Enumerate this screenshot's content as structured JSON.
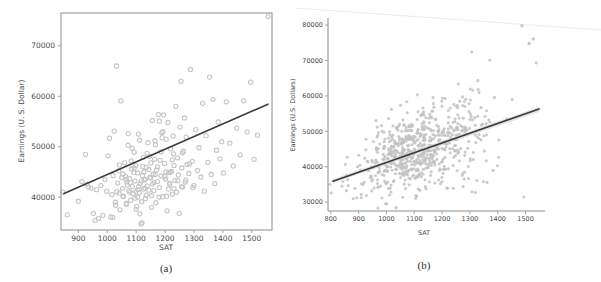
{
  "figure": {
    "background": "#ffffff",
    "marker_color": "#c2c2c2",
    "line_color": "#3b3b3b",
    "spine_color": "#8c8c8c"
  },
  "panels": [
    {
      "id": "a",
      "caption": "(a)",
      "xlabel": "SAT",
      "ylabel": "Earnings (U. S. Dollar)",
      "xticks": [
        "900",
        "1000",
        "1100",
        "1200",
        "1300",
        "1400",
        "1500"
      ],
      "yticks": [
        "40000",
        "50000",
        "60000",
        "70000"
      ]
    },
    {
      "id": "b",
      "caption": "(b)",
      "xlabel": "SAT",
      "ylabel": "Earnings (U.S. Dollars)",
      "xticks": [
        "800",
        "900",
        "1000",
        "1100",
        "1200",
        "1300",
        "1400",
        "1500"
      ],
      "yticks": [
        "30000",
        "40000",
        "50000",
        "60000",
        "70000",
        "80000"
      ]
    }
  ],
  "chart_data": [
    {
      "type": "scatter",
      "panel": "a",
      "title": "",
      "xlabel": "SAT",
      "ylabel": "Earnings (U. S. Dollar)",
      "xlim": [
        840,
        1570
      ],
      "ylim": [
        33500,
        76500
      ],
      "xticks": [
        900,
        1000,
        1100,
        1200,
        1300,
        1400,
        1500
      ],
      "yticks": [
        40000,
        50000,
        60000,
        70000
      ],
      "grid": false,
      "legend": null,
      "n_points": 200,
      "marker": "open-circle",
      "fit_line": {
        "x": [
          845,
          1560
        ],
        "y": [
          37800,
          56700
        ],
        "slope": 26.4,
        "intercept": 15500
      },
      "points": [
        [
          846,
          41000
        ],
        [
          862,
          36500
        ],
        [
          900,
          39200
        ],
        [
          912,
          43100
        ],
        [
          925,
          48500
        ],
        [
          930,
          42600
        ],
        [
          935,
          42000
        ],
        [
          944,
          41800
        ],
        [
          952,
          36800
        ],
        [
          958,
          35400
        ],
        [
          963,
          41500
        ],
        [
          970,
          35800
        ],
        [
          978,
          42300
        ],
        [
          985,
          36400
        ],
        [
          992,
          43500
        ],
        [
          998,
          41200
        ],
        [
          1003,
          48200
        ],
        [
          1008,
          51700
        ],
        [
          1012,
          36100
        ],
        [
          1016,
          40500
        ],
        [
          1020,
          44300
        ],
        [
          1024,
          53100
        ],
        [
          1028,
          39000
        ],
        [
          1032,
          66000
        ],
        [
          1036,
          42800
        ],
        [
          1040,
          45200
        ],
        [
          1044,
          37500
        ],
        [
          1047,
          59100
        ],
        [
          1050,
          43900
        ],
        [
          1053,
          41700
        ],
        [
          1056,
          40200
        ],
        [
          1060,
          46800
        ],
        [
          1063,
          44100
        ],
        [
          1066,
          38600
        ],
        [
          1069,
          42400
        ],
        [
          1072,
          50300
        ],
        [
          1075,
          41300
        ],
        [
          1078,
          43700
        ],
        [
          1081,
          39400
        ],
        [
          1084,
          45600
        ],
        [
          1087,
          42100
        ],
        [
          1090,
          40700
        ],
        [
          1093,
          48900
        ],
        [
          1096,
          43200
        ],
        [
          1099,
          41100
        ],
        [
          1102,
          38200
        ],
        [
          1105,
          44800
        ],
        [
          1108,
          52500
        ],
        [
          1111,
          40900
        ],
        [
          1114,
          42700
        ],
        [
          1117,
          34700
        ],
        [
          1120,
          34900
        ],
        [
          1123,
          46100
        ],
        [
          1126,
          41600
        ],
        [
          1129,
          43400
        ],
        [
          1132,
          39700
        ],
        [
          1135,
          45900
        ],
        [
          1138,
          42200
        ],
        [
          1141,
          50800
        ],
        [
          1144,
          41400
        ],
        [
          1147,
          48100
        ],
        [
          1150,
          43800
        ],
        [
          1153,
          40300
        ],
        [
          1156,
          55200
        ],
        [
          1159,
          44600
        ],
        [
          1162,
          42900
        ],
        [
          1165,
          51200
        ],
        [
          1168,
          38900
        ],
        [
          1171,
          45400
        ],
        [
          1174,
          43100
        ],
        [
          1177,
          56400
        ],
        [
          1180,
          41900
        ],
        [
          1183,
          47300
        ],
        [
          1186,
          44200
        ],
        [
          1189,
          52800
        ],
        [
          1192,
          40100
        ],
        [
          1195,
          56300
        ],
        [
          1198,
          46700
        ],
        [
          1201,
          43600
        ],
        [
          1204,
          51500
        ],
        [
          1207,
          37300
        ],
        [
          1210,
          54800
        ],
        [
          1213,
          44900
        ],
        [
          1216,
          42500
        ],
        [
          1219,
          49600
        ],
        [
          1222,
          45100
        ],
        [
          1225,
          40600
        ],
        [
          1228,
          52100
        ],
        [
          1231,
          46300
        ],
        [
          1234,
          43300
        ],
        [
          1237,
          58000
        ],
        [
          1240,
          41000
        ],
        [
          1243,
          47800
        ],
        [
          1246,
          44400
        ],
        [
          1249,
          36800
        ],
        [
          1252,
          53900
        ],
        [
          1255,
          63000
        ],
        [
          1258,
          45800
        ],
        [
          1261,
          42000
        ],
        [
          1264,
          49100
        ],
        [
          1267,
          55700
        ],
        [
          1270,
          43000
        ],
        [
          1273,
          51900
        ],
        [
          1276,
          46500
        ],
        [
          1282,
          44700
        ],
        [
          1288,
          65300
        ],
        [
          1294,
          47100
        ],
        [
          1300,
          42300
        ],
        [
          1306,
          53400
        ],
        [
          1312,
          45300
        ],
        [
          1318,
          49800
        ],
        [
          1324,
          44000
        ],
        [
          1330,
          58600
        ],
        [
          1336,
          41200
        ],
        [
          1342,
          52200
        ],
        [
          1348,
          46900
        ],
        [
          1354,
          63800
        ],
        [
          1360,
          44500
        ],
        [
          1366,
          59400
        ],
        [
          1372,
          42700
        ],
        [
          1378,
          49300
        ],
        [
          1384,
          54900
        ],
        [
          1390,
          47600
        ],
        [
          1396,
          51000
        ],
        [
          1402,
          44800
        ],
        [
          1412,
          58900
        ],
        [
          1424,
          50700
        ],
        [
          1436,
          46200
        ],
        [
          1448,
          53700
        ],
        [
          1460,
          48400
        ],
        [
          1472,
          59100
        ],
        [
          1484,
          52900
        ],
        [
          1496,
          62800
        ],
        [
          1508,
          47500
        ],
        [
          1520,
          52300
        ],
        [
          1556,
          75800
        ],
        [
          1065,
          43500
        ],
        [
          1078,
          41000
        ],
        [
          1092,
          44900
        ],
        [
          1105,
          40000
        ],
        [
          1118,
          43200
        ],
        [
          1131,
          41800
        ],
        [
          1144,
          45500
        ],
        [
          1157,
          42600
        ],
        [
          1083,
          47200
        ],
        [
          1096,
          39800
        ],
        [
          1109,
          42100
        ],
        [
          1122,
          44300
        ],
        [
          1135,
          40400
        ],
        [
          1148,
          43900
        ],
        [
          1161,
          41300
        ],
        [
          1174,
          46000
        ],
        [
          1041,
          40800
        ],
        [
          1054,
          44600
        ],
        [
          1067,
          38800
        ],
        [
          1080,
          42900
        ],
        [
          1093,
          45800
        ],
        [
          1106,
          41500
        ],
        [
          1119,
          39100
        ],
        [
          1132,
          43600
        ],
        [
          1186,
          49000
        ],
        [
          1199,
          44100
        ],
        [
          1212,
          41600
        ],
        [
          1225,
          47400
        ],
        [
          1190,
          51800
        ],
        [
          1203,
          45000
        ],
        [
          1216,
          42800
        ],
        [
          1229,
          48600
        ],
        [
          1029,
          38400
        ],
        [
          1042,
          46400
        ],
        [
          1055,
          40100
        ],
        [
          1068,
          43000
        ],
        [
          1260,
          48800
        ],
        [
          1272,
          43400
        ],
        [
          1284,
          46600
        ],
        [
          1296,
          41900
        ],
        [
          1019,
          36000
        ],
        [
          1033,
          41100
        ],
        [
          1153,
          38000
        ],
        [
          1166,
          44500
        ],
        [
          1179,
          40000
        ],
        [
          1100,
          37600
        ],
        [
          1113,
          36700
        ],
        [
          1126,
          45000
        ],
        [
          1205,
          40200
        ],
        [
          1218,
          44900
        ],
        [
          1231,
          41700
        ],
        [
          1244,
          43300
        ],
        [
          1257,
          42100
        ],
        [
          1193,
          53000
        ],
        [
          1180,
          55100
        ],
        [
          1167,
          50400
        ],
        [
          1073,
          52600
        ],
        [
          1086,
          49700
        ],
        [
          1099,
          46300
        ],
        [
          1112,
          51300
        ],
        [
          1125,
          47900
        ],
        [
          1138,
          48700
        ],
        [
          1151,
          46800
        ],
        [
          1164,
          47500
        ]
      ]
    },
    {
      "type": "scatter",
      "panel": "b",
      "title": "",
      "xlabel": "SAT",
      "ylabel": "Earnings (U.S. Dollars)",
      "xlim": [
        790,
        1570
      ],
      "ylim": [
        27500,
        82000
      ],
      "xticks": [
        800,
        900,
        1000,
        1100,
        1200,
        1300,
        1400,
        1500
      ],
      "yticks": [
        30000,
        40000,
        50000,
        60000,
        70000,
        80000
      ],
      "grid": false,
      "legend": null,
      "n_points": 700,
      "marker": "filled-circle",
      "fit_line": {
        "x": [
          805,
          1560
        ],
        "y": [
          36600,
          56700
        ],
        "slope": 26.6,
        "intercept": 15200
      },
      "ci_band": true,
      "outliers": [
        [
          1487,
          79800
        ],
        [
          1513,
          74800
        ],
        [
          1528,
          76100
        ],
        [
          1035,
          28400
        ]
      ],
      "density_note": "Dense elliptical cloud centered near SAT 1120, earnings 45000; spread widens toward higher SAT."
    }
  ]
}
